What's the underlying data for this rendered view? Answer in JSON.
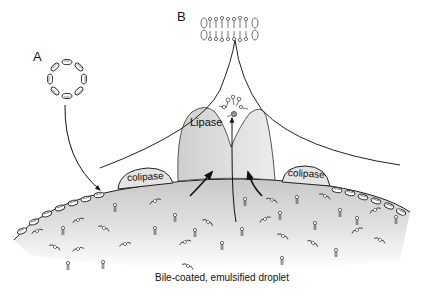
{
  "diagram": {
    "labels": {
      "panel_a": "A",
      "panel_b": "B",
      "enzyme": "Lipase",
      "cofactor_left": "colipase",
      "cofactor_right": "colipase",
      "caption": "Bile-coated, emulsified droplet"
    },
    "elements": [
      {
        "id": "micelle",
        "description": "Bile salt micelle (ring of amphipathic bile salts)",
        "panel": "A"
      },
      {
        "id": "bilayer",
        "description": "Mixed micelle / bilayer fragment with lipid products",
        "panel": "B"
      },
      {
        "id": "droplet",
        "description": "Emulsified lipid droplet coated with bile salts"
      },
      {
        "id": "lipase",
        "description": "Pancreatic lipase bound at droplet surface"
      },
      {
        "id": "colipase",
        "description": "Colipase anchoring lipase to surface",
        "count": 2
      },
      {
        "id": "products",
        "description": "Released fatty acids and monoglycerides above lipase"
      }
    ],
    "arrows": [
      {
        "from": "micelle",
        "to": "droplet surface",
        "description": "curved arrow from A down to droplet"
      },
      {
        "from": "droplet interior",
        "to": "lipase",
        "count": 2,
        "description": "curved arrows into lipase"
      },
      {
        "from": "droplet",
        "to": "products",
        "description": "vertical arrow up through lipase to products"
      }
    ],
    "colors": {
      "outline": "#1a1a1a",
      "lipase_fill": "#d9d9d9",
      "droplet_fill_top": "#cfcfcf",
      "droplet_fill_bottom": "#ffffff",
      "colipase_fill": "#e4e4e4"
    }
  }
}
